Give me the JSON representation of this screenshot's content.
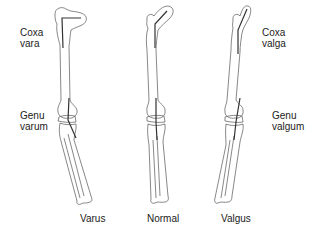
{
  "labels": {
    "coxa_vara": [
      "Coxa",
      "vara"
    ],
    "genu_varum": [
      "Genu",
      "varum"
    ],
    "coxa_valga": [
      "Coxa",
      "valga"
    ],
    "genu_valgum": [
      "Genu",
      "valgum"
    ]
  },
  "captions": {
    "varus": "Varus",
    "normal": "Normal",
    "valgus": "Valgus"
  }
}
